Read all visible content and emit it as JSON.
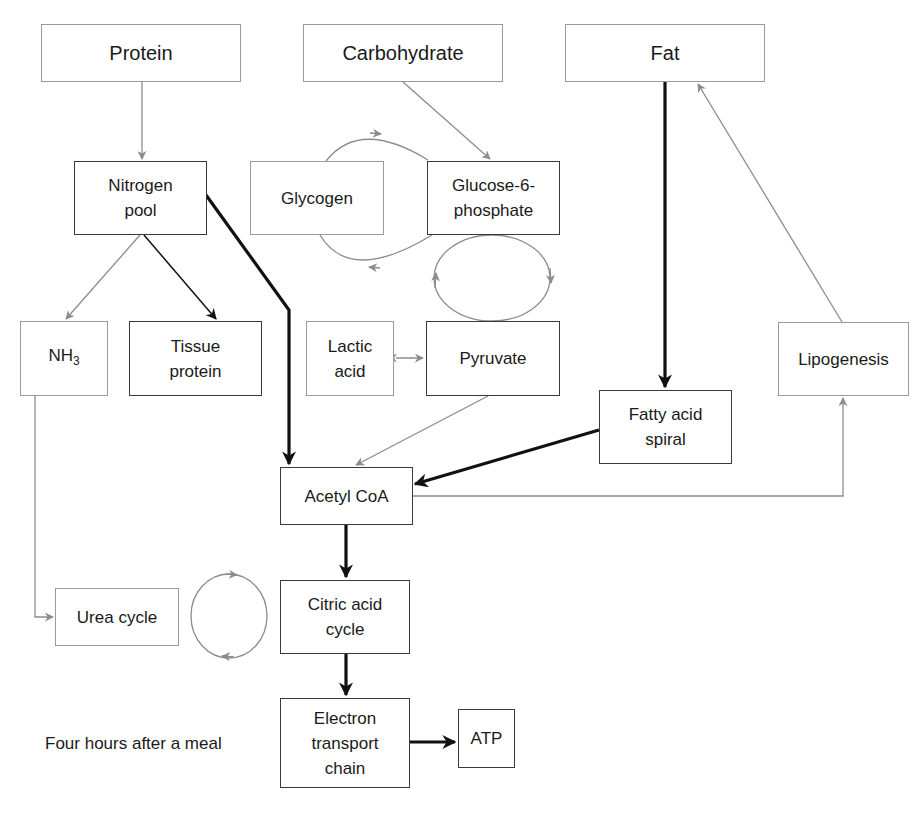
{
  "diagram": {
    "caption": "Four hours after a meal",
    "colors": {
      "active_path": "#111111",
      "inactive_path": "#8c8c8c",
      "active_border": "#3a3a3a",
      "inactive_border": "#9a9a9a"
    },
    "nodes": {
      "protein": {
        "label": "Protein",
        "style": "inactive"
      },
      "carbohydrate": {
        "label": "Carbohydrate",
        "style": "inactive"
      },
      "fat": {
        "label": "Fat",
        "style": "inactive"
      },
      "nitrogen_pool": {
        "label": "Nitrogen\npool",
        "style": "active"
      },
      "glycogen": {
        "label": "Glycogen",
        "style": "inactive"
      },
      "glucose_6_phosphate": {
        "label": "Glucose-6-\nphosphate",
        "style": "active"
      },
      "nh3": {
        "label": "NH",
        "subscript": "3",
        "style": "inactive"
      },
      "tissue_protein": {
        "label": "Tissue\nprotein",
        "style": "active"
      },
      "lactic_acid": {
        "label": "Lactic\nacid",
        "style": "inactive"
      },
      "pyruvate": {
        "label": "Pyruvate",
        "style": "active"
      },
      "fatty_acid_spiral": {
        "label": "Fatty acid\nspiral",
        "style": "active"
      },
      "lipogenesis": {
        "label": "Lipogenesis",
        "style": "inactive"
      },
      "acetyl_coa": {
        "label": "Acetyl CoA",
        "style": "active"
      },
      "urea_cycle": {
        "label": "Urea cycle",
        "style": "inactive"
      },
      "citric_acid_cycle": {
        "label": "Citric acid\ncycle",
        "style": "active"
      },
      "electron_transport_chain": {
        "label": "Electron\ntransport\nchain",
        "style": "active"
      },
      "atp": {
        "label": "ATP",
        "style": "active"
      }
    },
    "edges": [
      {
        "from": "Protein",
        "to": "Nitrogen pool",
        "style": "inactive"
      },
      {
        "from": "Carbohydrate",
        "to": "Glucose-6-phosphate",
        "style": "inactive"
      },
      {
        "from": "Glycogen",
        "to": "Glucose-6-phosphate",
        "style": "inactive",
        "kind": "cycle"
      },
      {
        "from": "Glucose-6-phosphate",
        "to": "Glycogen",
        "style": "inactive",
        "kind": "cycle"
      },
      {
        "from": "Glucose-6-phosphate",
        "to": "Pyruvate",
        "style": "inactive",
        "kind": "cycle"
      },
      {
        "from": "Pyruvate",
        "to": "Glucose-6-phosphate",
        "style": "inactive",
        "kind": "cycle"
      },
      {
        "from": "Nitrogen pool",
        "to": "NH3",
        "style": "inactive"
      },
      {
        "from": "Nitrogen pool",
        "to": "Tissue protein",
        "style": "active"
      },
      {
        "from": "Nitrogen pool",
        "to": "Acetyl CoA",
        "style": "active-bold"
      },
      {
        "from": "Lactic acid",
        "to": "Pyruvate",
        "style": "inactive",
        "kind": "bidirectional"
      },
      {
        "from": "Pyruvate",
        "to": "Acetyl CoA",
        "style": "inactive"
      },
      {
        "from": "Fat",
        "to": "Fatty acid spiral",
        "style": "active-bold"
      },
      {
        "from": "Fatty acid spiral",
        "to": "Acetyl CoA",
        "style": "active-bold"
      },
      {
        "from": "Acetyl CoA",
        "to": "Lipogenesis",
        "style": "inactive"
      },
      {
        "from": "Lipogenesis",
        "to": "Fat",
        "style": "inactive"
      },
      {
        "from": "Acetyl CoA",
        "to": "Citric acid cycle",
        "style": "active-bold"
      },
      {
        "from": "NH3",
        "to": "Urea cycle",
        "style": "inactive"
      },
      {
        "from": "Urea cycle",
        "to": "Citric acid cycle",
        "style": "inactive",
        "kind": "cycle"
      },
      {
        "from": "Citric acid cycle",
        "to": "Electron transport chain",
        "style": "active-bold"
      },
      {
        "from": "Electron transport chain",
        "to": "ATP",
        "style": "active-bold"
      }
    ]
  }
}
